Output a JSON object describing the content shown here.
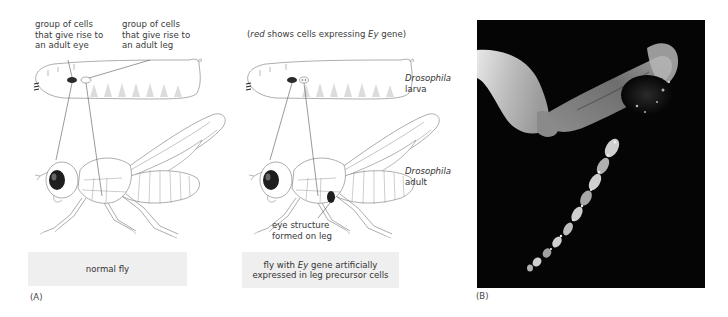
{
  "panel_a": {
    "label": "(A)",
    "legend_prefix_italic": "red",
    "legend_middle": " shows cells expressing ",
    "legend_gene_italic": "Ey",
    "legend_suffix": " gene)",
    "legend_open": "(",
    "eye_cells_label": [
      "group of cells",
      "that give rise to",
      "an adult eye"
    ],
    "leg_cells_label": [
      "group of cells",
      "that give rise to",
      "an adult leg"
    ],
    "larva_label": {
      "genus": "Drosophila",
      "stage": "larva"
    },
    "adult_label": {
      "genus": "Drosophila",
      "stage": "adult"
    },
    "ectopic_eye_label": [
      "eye structure",
      "formed on leg"
    ],
    "caption_normal": "normal fly",
    "caption_mutant": {
      "line1_pre": "fly with ",
      "line1_gene": "Ey",
      "line1_post": " gene artificially",
      "line2": "expressed in leg precursor cells"
    }
  },
  "panel_b": {
    "label": "(B)",
    "description": "micrograph of fly leg with eye tissue"
  },
  "colors": {
    "caption_bg": "#efefef",
    "outline": "#7a7a7a",
    "eye_fill": "#2a2a2a",
    "photo_bg": "#050505"
  }
}
